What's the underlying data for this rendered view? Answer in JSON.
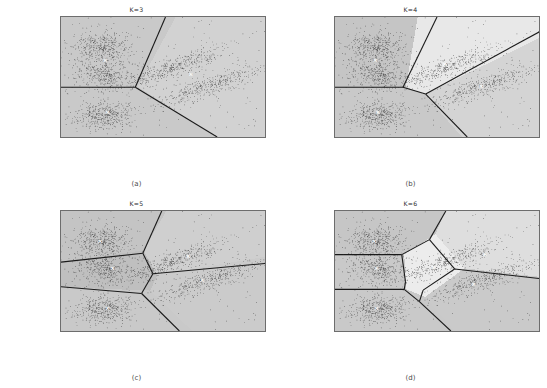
{
  "figure": {
    "background": "#ffffff",
    "plot_bg": "#c9c9c9",
    "line_color": "#1a1a1a",
    "point_color": "#2b2b2b",
    "centroid_marker": "×"
  },
  "panels": [
    {
      "id": "panel-a",
      "title": "K=3",
      "caption": "(a)",
      "k": 3
    },
    {
      "id": "panel-b",
      "title": "K=4",
      "caption": "(b)",
      "k": 4
    },
    {
      "id": "panel-c",
      "title": "K=5",
      "caption": "(c)",
      "k": 5
    },
    {
      "id": "panel-d",
      "title": "K=6",
      "caption": "(d)",
      "k": 6
    }
  ],
  "axes": {
    "xticks": [
      "−5",
      "−4",
      "−3",
      "−2",
      "−1",
      "0",
      "1",
      "2"
    ],
    "yticks": [
      "5",
      "4",
      "3",
      "2",
      "1",
      "0",
      "−1",
      "−2",
      "−3"
    ],
    "xlim": [
      -5.6,
      2.5
    ],
    "ylim": [
      -3.6,
      5.2
    ],
    "xlabel": "",
    "ylabel": ""
  },
  "chart_data": {
    "type": "scatter",
    "xlabel": "",
    "ylabel": "",
    "xlim": [
      -5.6,
      2.5
    ],
    "ylim": [
      -3.6,
      5.2
    ],
    "grid": false,
    "legend": "none",
    "source_clusters": [
      {
        "name": "upper-left",
        "center": [
          -4.0,
          3.0
        ],
        "spread": [
          0.55,
          0.55
        ],
        "n": 420
      },
      {
        "name": "mid-left",
        "center": [
          -3.8,
          1.0
        ],
        "spread": [
          0.7,
          0.6
        ],
        "n": 420
      },
      {
        "name": "lower-left",
        "center": [
          -3.9,
          -2.0
        ],
        "spread": [
          0.55,
          0.5
        ],
        "n": 420
      },
      {
        "name": "mid-diagonal",
        "center": [
          -1.2,
          1.5
        ],
        "spread": [
          0.85,
          0.65
        ],
        "n": 420
      },
      {
        "name": "right-diagonal",
        "center": [
          0.3,
          0.2
        ],
        "spread": [
          0.95,
          0.7
        ],
        "n": 420
      }
    ],
    "panels": [
      {
        "label": "(a)",
        "title": "K=3",
        "k": 3,
        "centroids": [
          [
            -3.85,
            1.95
          ],
          [
            -3.75,
            -1.85
          ],
          [
            -0.45,
            0.95
          ]
        ],
        "boundaries": [
          [
            [
              -5.6,
              0.05
            ],
            [
              -2.65,
              0.05
            ]
          ],
          [
            [
              -2.65,
              0.05
            ],
            [
              -1.45,
              5.2
            ]
          ],
          [
            [
              -2.65,
              0.05
            ],
            [
              0.6,
              -3.6
            ]
          ]
        ],
        "region_shades": [
          "#c9c9c9",
          "#c9c9c9",
          "#d2d2d2"
        ]
      },
      {
        "label": "(b)",
        "title": "K=4",
        "k": 4,
        "centroids": [
          [
            -4.0,
            1.95
          ],
          [
            -3.9,
            -1.85
          ],
          [
            -1.25,
            1.7
          ],
          [
            0.2,
            0.1
          ]
        ],
        "boundaries": [
          [
            [
              -5.6,
              0.05
            ],
            [
              -2.9,
              0.05
            ]
          ],
          [
            [
              -2.9,
              0.05
            ],
            [
              -1.55,
              5.2
            ]
          ],
          [
            [
              -2.9,
              0.05
            ],
            [
              -2.0,
              -0.45
            ]
          ],
          [
            [
              -2.0,
              -0.45
            ],
            [
              -0.35,
              -3.6
            ]
          ],
          [
            [
              -2.0,
              -0.45
            ],
            [
              2.5,
              4.1
            ]
          ]
        ],
        "region_shades": [
          "#c5c5c5",
          "#c9c9c9",
          "#e8e8e8",
          "#d4d4d4"
        ]
      },
      {
        "label": "(c)",
        "title": "K=5",
        "k": 5,
        "centroids": [
          [
            -4.05,
            2.95
          ],
          [
            -3.55,
            0.95
          ],
          [
            -3.75,
            -2.0
          ],
          [
            -0.55,
            1.85
          ],
          [
            0.0,
            0.1
          ]
        ],
        "boundaries": [
          [
            [
              -5.6,
              1.45
            ],
            [
              -2.35,
              2.1
            ]
          ],
          [
            [
              -5.6,
              -0.35
            ],
            [
              -2.4,
              -0.85
            ]
          ],
          [
            [
              -2.35,
              2.1
            ],
            [
              -1.95,
              0.6
            ]
          ],
          [
            [
              -1.95,
              0.6
            ],
            [
              -2.4,
              -0.85
            ]
          ],
          [
            [
              -2.35,
              2.1
            ],
            [
              -1.6,
              5.2
            ]
          ],
          [
            [
              -2.4,
              -0.85
            ],
            [
              -0.9,
              -3.6
            ]
          ],
          [
            [
              -1.95,
              0.6
            ],
            [
              2.5,
              1.35
            ]
          ]
        ],
        "region_shades": [
          "#c4c4c4",
          "#bfbfbf",
          "#c9c9c9",
          "#cfcfcf",
          "#cbcbcb"
        ]
      },
      {
        "label": "(d)",
        "title": "K=6",
        "k": 6,
        "centroids": [
          [
            -4.05,
            2.95
          ],
          [
            -3.95,
            0.95
          ],
          [
            -3.95,
            -2.0
          ],
          [
            -1.7,
            1.0
          ],
          [
            0.35,
            1.95
          ],
          [
            -0.1,
            -0.2
          ]
        ],
        "boundaries": [
          [
            [
              -5.6,
              2.0
            ],
            [
              -2.95,
              2.0
            ]
          ],
          [
            [
              -5.6,
              -0.55
            ],
            [
              -2.85,
              -0.55
            ]
          ],
          [
            [
              -2.95,
              2.0
            ],
            [
              -2.8,
              0.0
            ]
          ],
          [
            [
              -2.8,
              0.0
            ],
            [
              -2.85,
              -0.55
            ]
          ],
          [
            [
              -2.95,
              2.0
            ],
            [
              -1.85,
              3.1
            ]
          ],
          [
            [
              -1.85,
              3.1
            ],
            [
              -1.2,
              5.2
            ]
          ],
          [
            [
              -1.85,
              3.1
            ],
            [
              -0.85,
              0.95
            ]
          ],
          [
            [
              -0.85,
              0.95
            ],
            [
              2.5,
              0.25
            ]
          ],
          [
            [
              -0.85,
              0.95
            ],
            [
              -2.1,
              -0.6
            ]
          ],
          [
            [
              -2.85,
              -0.55
            ],
            [
              -2.25,
              -1.45
            ]
          ],
          [
            [
              -2.25,
              -1.45
            ],
            [
              -1.0,
              -3.6
            ]
          ],
          [
            [
              -2.1,
              -0.6
            ],
            [
              -2.25,
              -1.45
            ]
          ]
        ],
        "region_shades": [
          "#c6c6c6",
          "#c9c9c9",
          "#c9c9c9",
          "#ececec",
          "#dedede",
          "#cacaca"
        ]
      }
    ]
  }
}
